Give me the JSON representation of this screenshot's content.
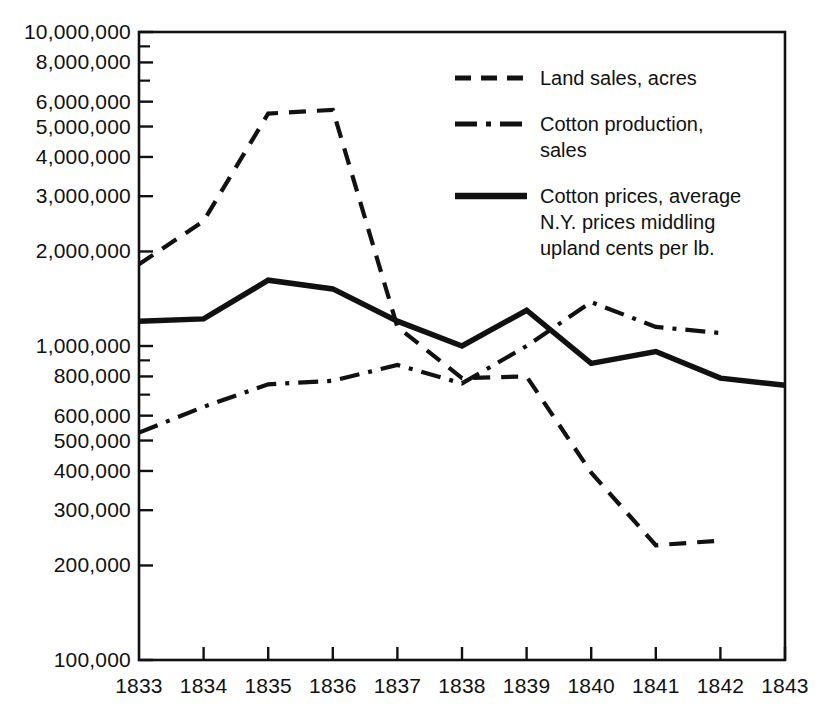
{
  "chart_data": {
    "type": "line",
    "title": "",
    "subtitle": "",
    "xlabel": "",
    "ylabel": "",
    "yscale": "log",
    "ylim": [
      100000,
      10000000
    ],
    "xlim": [
      1833,
      1843
    ],
    "grid": false,
    "legend_position": "upper-right-inside",
    "x": [
      1833,
      1834,
      1835,
      1836,
      1837,
      1838,
      1839,
      1840,
      1841,
      1842,
      1843
    ],
    "categories": [
      "1833",
      "1834",
      "1835",
      "1836",
      "1837",
      "1838",
      "1839",
      "1840",
      "1841",
      "1842",
      "1843"
    ],
    "y_tick_labels": [
      "10,000,000",
      "8,000,000",
      "6,000,000",
      "5,000,000",
      "4,000,000",
      "3,000,000",
      "2,000,000",
      "1,000,000",
      "800,000",
      "600,000",
      "500,000",
      "400,000",
      "300,000",
      "200,000",
      "100,000"
    ],
    "y_tick_values": [
      10000000,
      8000000,
      6000000,
      5000000,
      4000000,
      3000000,
      2000000,
      1000000,
      800000,
      600000,
      500000,
      400000,
      300000,
      200000,
      100000
    ],
    "y_minor_ticks": [
      9000000,
      7000000,
      900000,
      700000,
      90000
    ],
    "series": [
      {
        "name": "Land sales, acres",
        "style": "dashed",
        "color": "#111111",
        "x": [
          1833,
          1834,
          1835,
          1836,
          1837,
          1838,
          1839,
          1840,
          1841,
          1842
        ],
        "values": [
          1820000,
          2500000,
          5500000,
          5650000,
          1150000,
          790000,
          800000,
          395000,
          232000,
          240000
        ]
      },
      {
        "name": "Cotton production, sales",
        "style": "dash-dot",
        "color": "#111111",
        "x": [
          1833,
          1834,
          1835,
          1836,
          1837,
          1838,
          1839,
          1840,
          1841,
          1842
        ],
        "values": [
          530000,
          640000,
          755000,
          775000,
          870000,
          760000,
          1000000,
          1380000,
          1150000,
          1100000
        ]
      },
      {
        "name": "Cotton prices, average N.Y. prices middling upland cents per lb.",
        "style": "solid",
        "color": "#111111",
        "x": [
          1833,
          1834,
          1835,
          1836,
          1837,
          1838,
          1839,
          1840,
          1841,
          1842,
          1843
        ],
        "values": [
          1200000,
          1220000,
          1620000,
          1520000,
          1200000,
          1000000,
          1300000,
          880000,
          960000,
          790000,
          750000
        ]
      }
    ],
    "legend": [
      {
        "style": "dashed",
        "lines": [
          "Land sales, acres"
        ]
      },
      {
        "style": "dash-dot",
        "lines": [
          "Cotton production,",
          "sales"
        ]
      },
      {
        "style": "solid",
        "lines": [
          "Cotton prices, average",
          "N.Y.  prices middling",
          "upland cents per lb."
        ]
      }
    ]
  },
  "colors": {
    "ink": "#111111",
    "background": "#ffffff"
  }
}
